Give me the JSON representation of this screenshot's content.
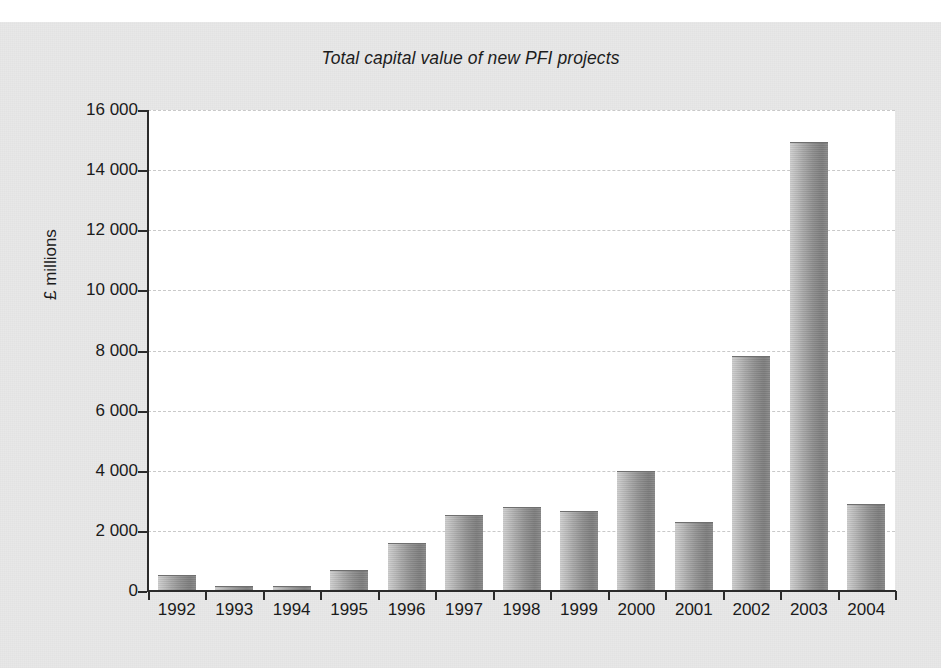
{
  "chart_data": {
    "type": "bar",
    "title": "Total capital value of new PFI projects",
    "xlabel": "",
    "ylabel": "£ millions",
    "categories": [
      "1992",
      "1993",
      "1994",
      "1995",
      "1996",
      "1997",
      "1998",
      "1999",
      "2000",
      "2001",
      "2002",
      "2003",
      "2004"
    ],
    "values": [
      500,
      150,
      150,
      650,
      1550,
      2480,
      2750,
      2620,
      3950,
      2250,
      7800,
      14900,
      2850
    ],
    "ylim": [
      0,
      16000
    ],
    "ytick_values": [
      0,
      2000,
      4000,
      6000,
      8000,
      10000,
      12000,
      14000,
      16000
    ],
    "ytick_labels": [
      "0",
      "2 000",
      "4 000",
      "6 000",
      "8 000",
      "10 000",
      "12 000",
      "14 000",
      "16 000"
    ],
    "grid": "horizontal-dashed",
    "legend": "none",
    "series_name": "Total capital value",
    "bar_style": "grayscale cylinder gradient"
  },
  "colors": {
    "page_background": "#ffffff",
    "paper_background": "#e8e8e8",
    "plot_background": "#ffffff",
    "axis": "#2b2b2b",
    "gridline": "#c9c9c9",
    "bar_light": "#cfcfcf",
    "bar_dark": "#7e7e7e",
    "text": "#1b1b1b"
  }
}
